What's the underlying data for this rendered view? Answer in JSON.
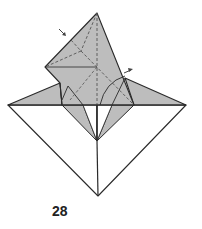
{
  "diagram": {
    "type": "origami-folding-step",
    "step_number": "28",
    "colors": {
      "paper_colored": "#bdbdbd",
      "paper_white": "#ffffff",
      "line": "#2a2a2a",
      "dashed_line": "#555555"
    },
    "elements": {
      "valley_fold_lines": "dashed",
      "arrows": [
        "push-in-arrow-top-left",
        "push-in-arrow-right"
      ]
    }
  }
}
